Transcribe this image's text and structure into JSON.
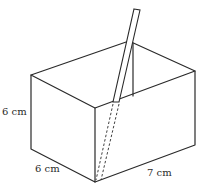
{
  "diagram": {
    "type": "3d-box-with-straw",
    "colors": {
      "stroke": "#2a2a2a",
      "background": "#ffffff"
    },
    "labels": {
      "height": "6 cm",
      "depth": "6 cm",
      "length": "7 cm"
    }
  }
}
